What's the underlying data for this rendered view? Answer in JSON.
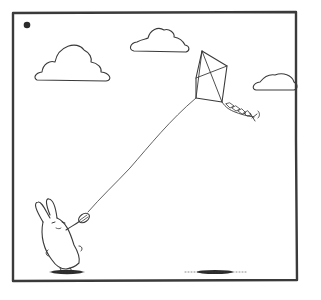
{
  "panel": {
    "description": "Comic panel: a white bunny flying a diamond kite in a sky with three clouds",
    "colors": {
      "ink": "#3a3a3a",
      "background": "#ffffff",
      "shadow": "#2b2b2b"
    }
  },
  "elements": {
    "frame": "panel-border",
    "dot": "corner-dot",
    "clouds": [
      "cloud-left",
      "cloud-center",
      "cloud-right"
    ],
    "kite": "diamond-kite-with-bow-tail",
    "string": "kite-string",
    "character": "bunny-holding-spool",
    "shadows": [
      "bunny-shadow",
      "kite-shadow"
    ]
  }
}
